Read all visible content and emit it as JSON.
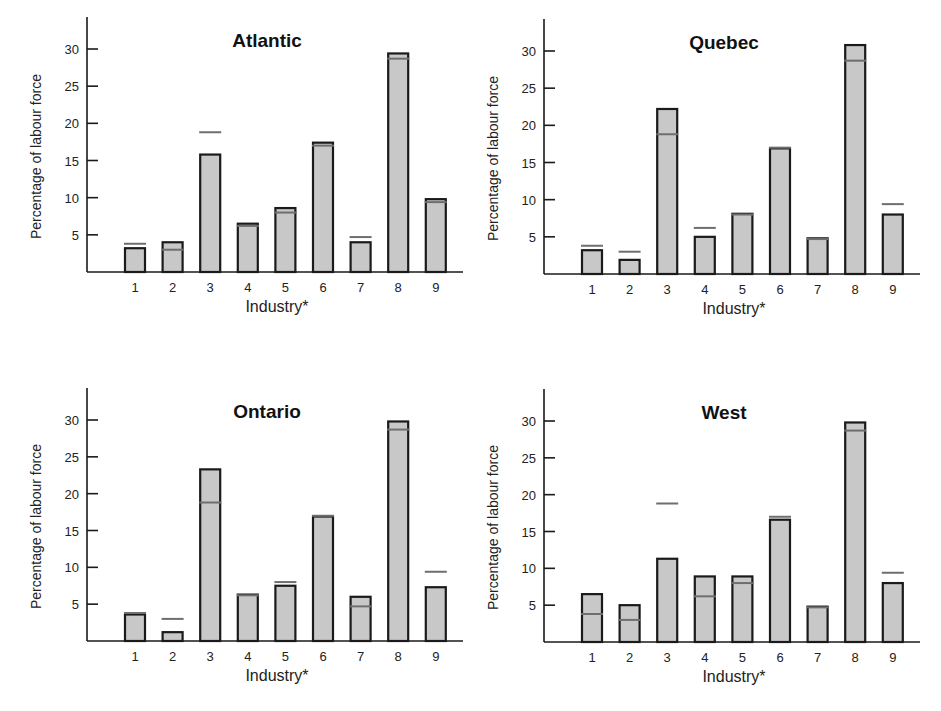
{
  "colors": {
    "bar_fill": "#c8c8c8",
    "bar_stroke": "#1a1a1a",
    "marker": "#6e6e6e",
    "axis": "#1a1a1a"
  },
  "chart_data": [
    {
      "type": "bar",
      "title": "Atlantic",
      "xlabel": "Industry*",
      "ylabel": "Percentage of labour force",
      "categories": [
        "1",
        "2",
        "3",
        "4",
        "5",
        "6",
        "7",
        "8",
        "9"
      ],
      "yticks": [
        5,
        10,
        15,
        20,
        25,
        30
      ],
      "ylim": [
        0,
        34
      ],
      "grid": false,
      "series": [
        {
          "name": "Region",
          "values": [
            3.2,
            4.0,
            15.8,
            6.5,
            8.6,
            17.4,
            4.0,
            29.4,
            9.8
          ]
        },
        {
          "name": "National average (marker)",
          "values": [
            3.8,
            3.0,
            18.8,
            6.2,
            8.0,
            17.0,
            4.7,
            28.7,
            9.4
          ]
        }
      ]
    },
    {
      "type": "bar",
      "title": "Quebec",
      "xlabel": "Industry*",
      "ylabel": "Percentage of labour force",
      "categories": [
        "1",
        "2",
        "3",
        "4",
        "5",
        "6",
        "7",
        "8",
        "9"
      ],
      "yticks": [
        5,
        10,
        15,
        20,
        25,
        30
      ],
      "ylim": [
        0,
        34
      ],
      "grid": false,
      "series": [
        {
          "name": "Region",
          "values": [
            3.2,
            1.9,
            22.2,
            5.0,
            8.1,
            16.9,
            4.8,
            30.8,
            8.0
          ]
        },
        {
          "name": "National average (marker)",
          "values": [
            3.8,
            3.0,
            18.8,
            6.2,
            8.0,
            17.0,
            4.7,
            28.7,
            9.4
          ]
        }
      ]
    },
    {
      "type": "bar",
      "title": "Ontario",
      "xlabel": "Industry*",
      "ylabel": "Percentage of labour force",
      "categories": [
        "1",
        "2",
        "3",
        "4",
        "5",
        "6",
        "7",
        "8",
        "9"
      ],
      "yticks": [
        5,
        10,
        15,
        20,
        25,
        30
      ],
      "ylim": [
        0,
        34
      ],
      "grid": false,
      "series": [
        {
          "name": "Region",
          "values": [
            3.6,
            1.2,
            23.3,
            6.3,
            7.5,
            16.9,
            6.0,
            29.8,
            7.3
          ]
        },
        {
          "name": "National average (marker)",
          "values": [
            3.8,
            3.0,
            18.8,
            6.2,
            8.0,
            17.0,
            4.7,
            28.7,
            9.4
          ]
        }
      ]
    },
    {
      "type": "bar",
      "title": "West",
      "xlabel": "Industry*",
      "ylabel": "Percentage of labour force",
      "categories": [
        "1",
        "2",
        "3",
        "4",
        "5",
        "6",
        "7",
        "8",
        "9"
      ],
      "yticks": [
        5,
        10,
        15,
        20,
        25,
        30
      ],
      "ylim": [
        0,
        34
      ],
      "grid": false,
      "series": [
        {
          "name": "Region",
          "values": [
            6.5,
            5.0,
            11.3,
            8.9,
            8.9,
            16.6,
            4.8,
            29.8,
            8.0
          ]
        },
        {
          "name": "National average (marker)",
          "values": [
            3.8,
            3.0,
            18.8,
            6.2,
            8.0,
            17.0,
            4.7,
            28.7,
            9.4
          ]
        }
      ]
    }
  ],
  "panels": [
    {
      "left": 0,
      "top": 0,
      "axis_x": 87,
      "base_y": 272,
      "y30": 49
    },
    {
      "left": 470,
      "top": 0,
      "axis_x": 74,
      "base_y": 274,
      "y30": 51
    },
    {
      "left": 0,
      "top": 370,
      "axis_x": 87,
      "base_y": 271,
      "y30": 50
    },
    {
      "left": 470,
      "top": 370,
      "axis_x": 74,
      "base_y": 272,
      "y30": 51
    }
  ]
}
